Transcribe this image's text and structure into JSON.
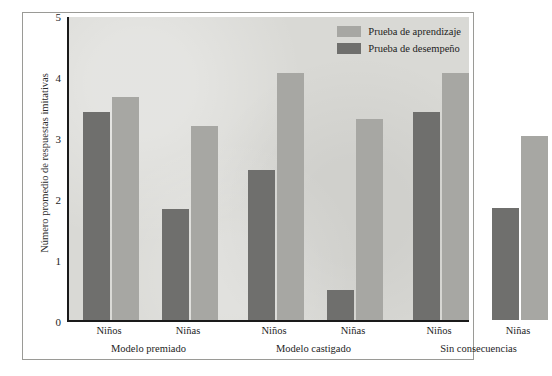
{
  "chart_data": {
    "type": "bar",
    "title": "",
    "xlabel": "",
    "ylabel": "Número promedio de respuestas imitativas",
    "ylim": [
      0,
      5
    ],
    "yticks": [
      "0",
      "1",
      "2",
      "3",
      "4",
      "5"
    ],
    "grid": false,
    "legend_position": "top-right",
    "groups": [
      {
        "label": "Modelo premiado",
        "categories": [
          "Niños",
          "Niñas"
        ]
      },
      {
        "label": "Modelo castigado",
        "categories": [
          "Niños",
          "Niñas"
        ]
      },
      {
        "label": "Sin consecuencias",
        "categories": [
          "Niños",
          "Niñas"
        ]
      }
    ],
    "categories": [
      "Modelo premiado - Niños",
      "Modelo premiado - Niñas",
      "Modelo castigado - Niños",
      "Modelo castigado - Niñas",
      "Sin consecuencias - Niños",
      "Sin consecuencias - Niñas"
    ],
    "series": [
      {
        "name": "Prueba de aprendizaje",
        "color": "#a7a7a3",
        "values": [
          3.66,
          3.18,
          4.05,
          3.29,
          4.05,
          3.01
        ]
      },
      {
        "name": "Prueba de desempeño",
        "color": "#6f6f6d",
        "values": [
          3.41,
          1.82,
          2.46,
          0.5,
          3.41,
          1.84
        ]
      }
    ]
  },
  "legend": {
    "items": [
      {
        "label": "Prueba de aprendizaje",
        "swatch": "learn"
      },
      {
        "label": "Prueba de desempeño",
        "swatch": "perf"
      }
    ]
  },
  "colors": {
    "learning_bar": "#a7a7a3",
    "performance_bar": "#6f6f6d",
    "plot_background": "#d9d9d5",
    "axis": "#1a1a1a",
    "frame": "#9a9a96",
    "text": "#1d1d1d"
  }
}
